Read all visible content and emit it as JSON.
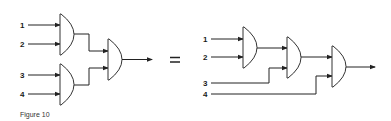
{
  "figure": {
    "caption": "Figure 10",
    "equals_sign": "="
  },
  "left_circuit": {
    "description": "Balanced tree of AND gates",
    "inputs": [
      {
        "label": "1"
      },
      {
        "label": "2"
      },
      {
        "label": "3"
      },
      {
        "label": "4"
      }
    ],
    "gates": [
      {
        "id": "A",
        "type": "AND",
        "inputs": [
          "1",
          "2"
        ]
      },
      {
        "id": "B",
        "type": "AND",
        "inputs": [
          "3",
          "4"
        ]
      },
      {
        "id": "C",
        "type": "AND",
        "inputs": [
          "A",
          "B"
        ]
      }
    ],
    "output": "C"
  },
  "right_circuit": {
    "description": "Cascaded chain of AND gates",
    "inputs": [
      {
        "label": "1"
      },
      {
        "label": "2"
      },
      {
        "label": "3"
      },
      {
        "label": "4"
      }
    ],
    "gates": [
      {
        "id": "G1",
        "type": "AND",
        "inputs": [
          "1",
          "2"
        ]
      },
      {
        "id": "G2",
        "type": "AND",
        "inputs": [
          "G1",
          "3"
        ]
      },
      {
        "id": "G3",
        "type": "AND",
        "inputs": [
          "G2",
          "4"
        ]
      }
    ],
    "output": "G3"
  },
  "colors": {
    "line": "#222222",
    "background": "#ffffff"
  }
}
